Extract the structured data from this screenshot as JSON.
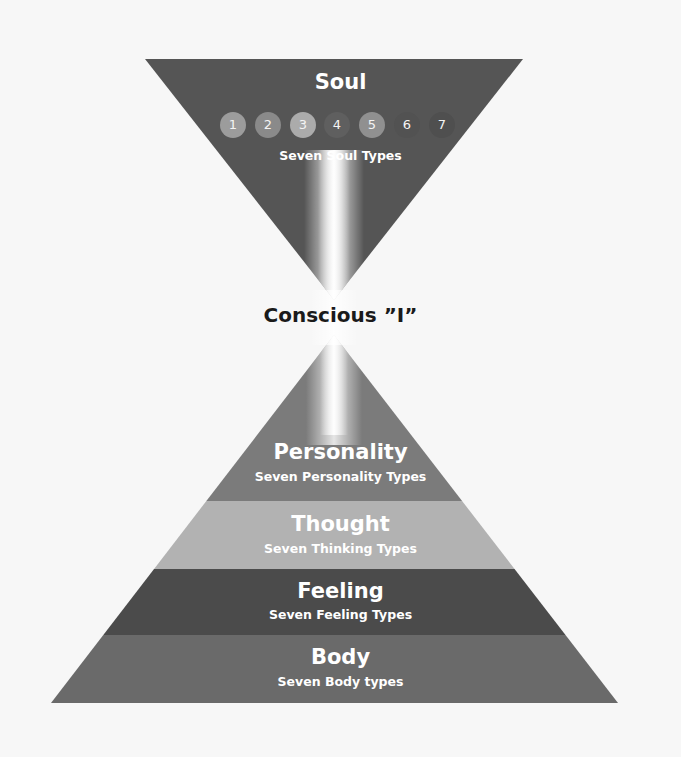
{
  "soul": {
    "title": "Soul",
    "subtitle": "Seven Soul Types",
    "color": "#555555",
    "types": [
      {
        "label": "1",
        "color": "#9c9c9c"
      },
      {
        "label": "2",
        "color": "#8a8a8a"
      },
      {
        "label": "3",
        "color": "#ababab"
      },
      {
        "label": "4",
        "color": "#5f5f5f"
      },
      {
        "label": "5",
        "color": "#909090"
      },
      {
        "label": "6",
        "color": "#525252"
      },
      {
        "label": "7",
        "color": "#4f4f4f"
      }
    ]
  },
  "center": {
    "label": "Conscious ”I”"
  },
  "layers": [
    {
      "title": "Personality",
      "subtitle": "Seven Personality Types",
      "color": "#7b7b7b"
    },
    {
      "title": "Thought",
      "subtitle": "Seven Thinking Types",
      "color": "#b2b2b2"
    },
    {
      "title": "Feeling",
      "subtitle": "Seven Feeling Types",
      "color": "#4b4b4b"
    },
    {
      "title": "Body",
      "subtitle": "Seven Body types",
      "color": "#6a6a6a"
    }
  ]
}
